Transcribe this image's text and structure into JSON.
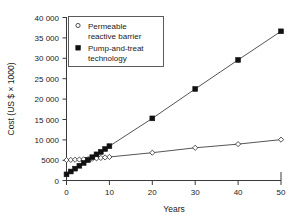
{
  "chart_data": {
    "type": "line",
    "title": "",
    "xlabel": "Years",
    "ylabel": "Cost (US $ × 1000)",
    "xlim": [
      0,
      50
    ],
    "ylim": [
      0,
      40000
    ],
    "grid": false,
    "legend_position": "top-left",
    "xticks": [
      "0",
      "10",
      "20",
      "30",
      "40",
      "50"
    ],
    "xtick_values": [
      0,
      10,
      20,
      30,
      40,
      50
    ],
    "yticks": [
      "0",
      "5000",
      "10 000",
      "15 000",
      "20 000",
      "25 000",
      "30 000",
      "35 000",
      "40 000"
    ],
    "ytick_values": [
      0,
      5000,
      10000,
      15000,
      20000,
      25000,
      30000,
      35000,
      40000
    ],
    "series": [
      {
        "name": "Permeable reactive barrier",
        "marker": "open-diamond",
        "x": [
          0,
          1,
          2,
          3,
          4,
          5,
          6,
          7,
          8,
          9,
          10,
          20,
          30,
          40,
          50
        ],
        "values": [
          5000,
          5040,
          5080,
          5130,
          5180,
          5230,
          5320,
          5420,
          5520,
          5640,
          5760,
          6800,
          8000,
          8900,
          10000
        ]
      },
      {
        "name": "Pump-and-treat technology",
        "marker": "filled-square",
        "x": [
          0,
          1,
          2,
          3,
          4,
          5,
          6,
          7,
          8,
          9,
          10,
          20,
          30,
          40,
          50
        ],
        "values": [
          1500,
          2200,
          2900,
          3600,
          4300,
          5000,
          5700,
          6400,
          7000,
          7700,
          8400,
          15200,
          22400,
          29500,
          36500
        ]
      }
    ]
  },
  "legend": {
    "entries": [
      {
        "label_line1": "Permeable",
        "label_line2": "reactive barrier",
        "marker": "open-diamond"
      },
      {
        "label_line1": "Pump-and-treat",
        "label_line2": "technology",
        "marker": "filled-square"
      }
    ]
  },
  "colors": {
    "axis": "#3a3a3a",
    "series_line": "#2a2a2a",
    "marker_fill": "#111111",
    "background": "#ffffff"
  }
}
